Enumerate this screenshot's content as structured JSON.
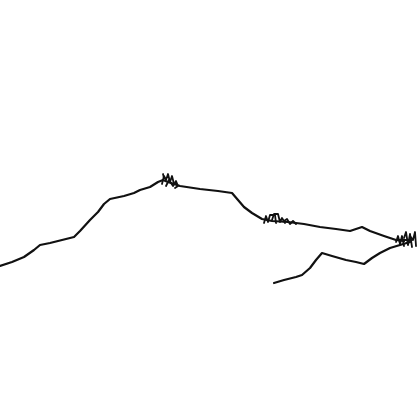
{
  "sketch": {
    "background": "#ffffff",
    "ink_color": "#111111",
    "stroke_width": 2.2,
    "strokes": [
      {
        "name": "main-ridge",
        "points": "0,266 12,262 24,257 34,250 40,245 50,243 62,240 74,237 80,231 90,220 98,212 104,204 110,199 124,196 134,193 140,190 150,187 158,182 163,180 168,182 180,186 200,189 218,191 232,193 238,200 244,207 252,213 262,219 272,221 288,222 304,224 320,227 336,229 350,231 356,229 362,227 370,231 384,236 396,240 404,241"
      },
      {
        "name": "lower-ridge",
        "points": "274,283 284,280 296,277 302,275 310,268 316,260 322,253 332,256 346,260 356,262 364,264 372,258 380,253 390,248 400,245 410,242"
      }
    ],
    "scribbles": [
      {
        "name": "scribble-peak",
        "paths": [
          "M162,184 L164,176 L166,180 L168,174 L170,182 L172,176 L174,184",
          "M166,186 L169,180 L173,186 L176,181 L178,186 L175,188",
          "M164,178 L163,174"
        ]
      },
      {
        "name": "scribble-middle",
        "paths": [
          "M264,223 L266,216 L268,222 L270,215 L275,215 L276,223",
          "M272,220 L274,214 L278,214 L280,222 L282,218 L285,223",
          "M284,221 L287,219 L290,224 L293,221 L296,224"
        ]
      },
      {
        "name": "scribble-right",
        "paths": [
          "M396,242 L398,236 L400,244 L402,236 L404,246",
          "M404,238 L406,232 L408,245 L410,234 L412,247",
          "M410,236 L413,240 L415,232 L416,246",
          "M398,240 L412,240"
        ]
      }
    ]
  }
}
